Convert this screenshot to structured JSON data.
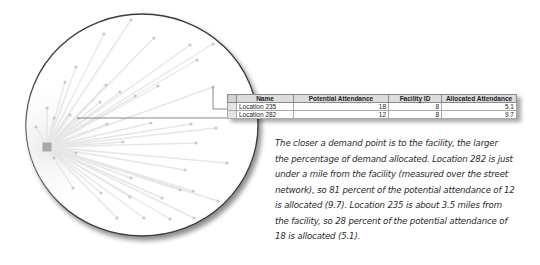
{
  "map": {
    "facility": {
      "x": 47,
      "y": 147,
      "size": 9,
      "color": "#a8a8a8"
    },
    "circle": {
      "cx": 142,
      "cy": 125,
      "rx": 116,
      "ry": 111,
      "stroke": "#3a3a3a"
    },
    "line_color": "#e6e6e6",
    "point_color": "#c9c9c9",
    "demand_points": [
      [
        131,
        20
      ],
      [
        104,
        34
      ],
      [
        154,
        38
      ],
      [
        190,
        45
      ],
      [
        213,
        44
      ],
      [
        197,
        60
      ],
      [
        76,
        67
      ],
      [
        65,
        82
      ],
      [
        106,
        85
      ],
      [
        120,
        92
      ],
      [
        135,
        96
      ],
      [
        158,
        86
      ],
      [
        100,
        102
      ],
      [
        47,
        108
      ],
      [
        54,
        118
      ],
      [
        70,
        115
      ],
      [
        36,
        127
      ],
      [
        107,
        124
      ],
      [
        151,
        123
      ],
      [
        191,
        124
      ],
      [
        216,
        128
      ],
      [
        123,
        142
      ],
      [
        196,
        143
      ],
      [
        54,
        158
      ],
      [
        76,
        153
      ],
      [
        227,
        163
      ],
      [
        185,
        170
      ],
      [
        131,
        178
      ],
      [
        180,
        190
      ],
      [
        193,
        191
      ],
      [
        73,
        188
      ],
      [
        101,
        193
      ],
      [
        130,
        197
      ],
      [
        162,
        198
      ],
      [
        218,
        201
      ],
      [
        117,
        218
      ],
      [
        144,
        218
      ],
      [
        170,
        219
      ],
      [
        194,
        218
      ],
      [
        213,
        87
      ],
      [
        78,
        118
      ]
    ],
    "callouts": [
      {
        "label": "Location 235",
        "from": [
          213,
          87
        ],
        "path": [
          [
            213,
            87
          ],
          [
            213,
            109
          ],
          [
            228,
            109
          ]
        ]
      },
      {
        "label": "Location 282",
        "from": [
          78,
          118
        ],
        "path": [
          [
            78,
            118
          ],
          [
            228,
            118
          ]
        ]
      }
    ]
  },
  "table": {
    "columns": [
      "Name",
      "Potential Attendance",
      "Facility ID",
      "Allocated Attendance"
    ],
    "rows": [
      {
        "name": "Location 235",
        "potential_attendance": "18",
        "facility_id": "8",
        "allocated_attendance": "5.1"
      },
      {
        "name": "Location 282",
        "potential_attendance": "12",
        "facility_id": "8",
        "allocated_attendance": "9.7"
      }
    ]
  },
  "caption": {
    "lines": [
      "The closer a demand point is to the facility, the larger",
      "the percentage of demand allocated. Location 282 is just",
      "under a mile from the facility (measured over the street",
      "network), so 81 percent of the potential attendance of 12",
      "is allocated (9.7). Location 235 is about 3.5 miles from",
      "the facility, so 28 percent of the potential attendance of",
      "18 is allocated (5.1)."
    ]
  }
}
